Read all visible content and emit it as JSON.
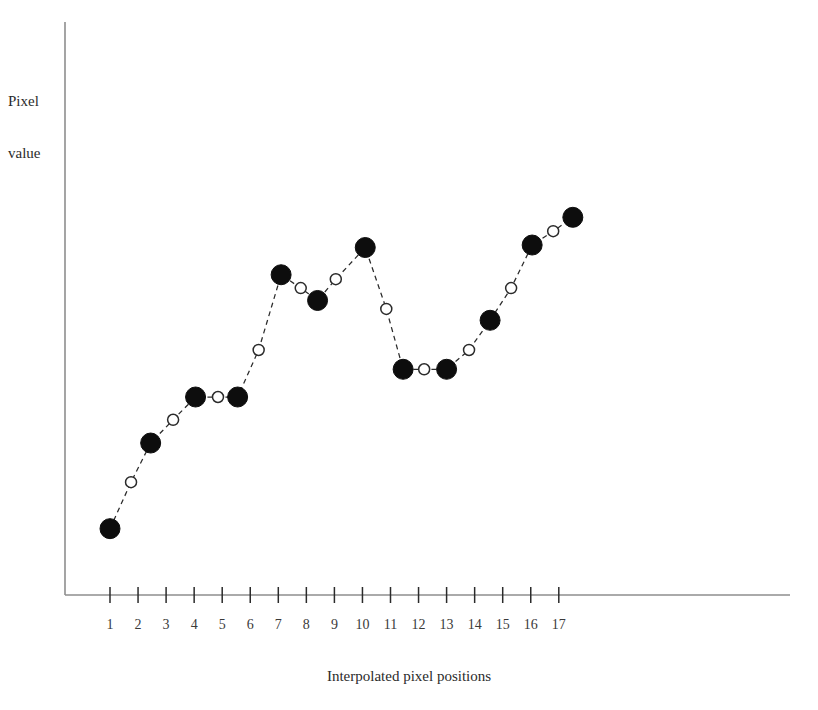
{
  "chart_data": {
    "type": "scatter",
    "title": "",
    "xlabel": "Interpolated pixel positions",
    "ylabel": "Pixel value",
    "ylabel_lines": [
      "Pixel",
      "value"
    ],
    "grid": false,
    "legend": null,
    "xlim": [
      0.5,
      17.9
    ],
    "ylim": [
      0,
      10
    ],
    "xticks": [
      1,
      2,
      3,
      4,
      5,
      6,
      7,
      8,
      9,
      10,
      11,
      12,
      13,
      14,
      15,
      16,
      17
    ],
    "xtick_labels": [
      "1",
      "2",
      "3",
      "4",
      "5",
      "6",
      "7",
      "8",
      "9",
      "10",
      "11",
      "12",
      "13",
      "14",
      "15",
      "16",
      "17"
    ],
    "yticks": [],
    "ytick_labels": [],
    "series": [
      {
        "name": "Original pixels",
        "marker": "filled-circle",
        "marker_size": 20,
        "color": "#0d0d0d",
        "points": [
          {
            "x": 1.0,
            "y": 1.34
          },
          {
            "x": 2.45,
            "y": 3.07
          },
          {
            "x": 4.05,
            "y": 4.0
          },
          {
            "x": 5.55,
            "y": 4.0
          },
          {
            "x": 7.1,
            "y": 6.47
          },
          {
            "x": 8.4,
            "y": 5.95
          },
          {
            "x": 10.1,
            "y": 7.02
          },
          {
            "x": 11.45,
            "y": 4.56
          },
          {
            "x": 13.0,
            "y": 4.56
          },
          {
            "x": 14.55,
            "y": 5.55
          },
          {
            "x": 16.05,
            "y": 7.07
          },
          {
            "x": 17.5,
            "y": 7.63
          }
        ]
      },
      {
        "name": "Interpolated pixels",
        "marker": "hollow-circle",
        "marker_size": 11,
        "color": "#2b2b2b",
        "points": [
          {
            "x": 1.75,
            "y": 2.28
          },
          {
            "x": 3.25,
            "y": 3.54
          },
          {
            "x": 4.85,
            "y": 4.0
          },
          {
            "x": 6.3,
            "y": 4.95
          },
          {
            "x": 7.8,
            "y": 6.2
          },
          {
            "x": 9.05,
            "y": 6.38
          },
          {
            "x": 10.85,
            "y": 5.78
          },
          {
            "x": 12.2,
            "y": 4.56
          },
          {
            "x": 13.8,
            "y": 4.95
          },
          {
            "x": 15.3,
            "y": 6.2
          },
          {
            "x": 16.8,
            "y": 7.35
          }
        ]
      }
    ],
    "connector": {
      "style": "dashed",
      "color": "#2b2b2b",
      "description": "All points connected in x order by a dashed polyline"
    },
    "sequence_y_in_x_order": [
      1.34,
      2.28,
      3.07,
      3.54,
      4.0,
      4.0,
      4.0,
      4.95,
      6.47,
      6.2,
      5.95,
      6.38,
      7.02,
      5.78,
      4.56,
      4.56,
      4.56,
      4.95,
      5.55,
      6.2,
      7.07,
      7.35,
      7.63
    ]
  },
  "axes": {
    "x_axis_title": "Interpolated pixel positions",
    "y_axis_title_line1": "Pixel",
    "y_axis_title_line2": "value"
  }
}
